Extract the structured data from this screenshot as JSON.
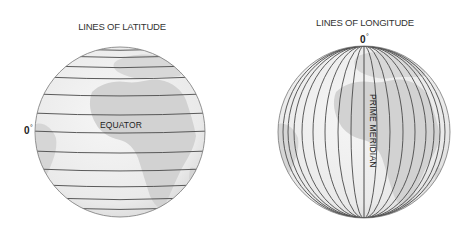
{
  "latitude_panel": {
    "title": "LINES OF LATITUDE",
    "degree_label": "0",
    "degree_symbol": "°",
    "line_label": "EQUATOR",
    "globe": {
      "cx": 120,
      "cy": 132,
      "r": 85
    },
    "line_offsets_y": [
      -82,
      -75,
      -65,
      -54,
      -37,
      -18,
      0,
      20,
      38,
      54,
      67,
      77
    ]
  },
  "longitude_panel": {
    "title": "LINES OF LONGITUDE",
    "degree_label": "0",
    "degree_symbol": "°",
    "line_label": "PRIME MERIDIAN",
    "globe": {
      "cx": 364,
      "cy": 132,
      "r": 86
    },
    "meridian_half_widths": [
      0,
      13,
      26,
      39,
      51,
      62,
      70,
      76,
      81
    ]
  },
  "colors": {
    "ocean": "#eeeeee",
    "land": "#d2d2d2",
    "grid_line": "#4a4a4a",
    "outline": "#777777",
    "text": "#222222"
  }
}
